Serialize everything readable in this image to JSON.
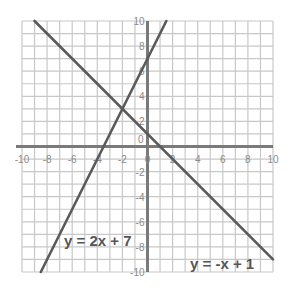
{
  "chart_data": {
    "type": "line",
    "title": "",
    "xlabel": "",
    "ylabel": "",
    "xlim": [
      -10,
      10
    ],
    "ylim": [
      -10,
      10
    ],
    "grid": true,
    "x_ticks": [
      -10,
      -8,
      -6,
      -4,
      -2,
      0,
      2,
      4,
      6,
      8,
      10
    ],
    "y_ticks": [
      -10,
      -8,
      -6,
      -4,
      -2,
      0,
      2,
      4,
      6,
      8,
      10
    ],
    "series": [
      {
        "name": "y = 2x + 7",
        "slope": 2,
        "intercept": 7,
        "x": [
          -8.5,
          1.5
        ],
        "y": [
          -10,
          10
        ]
      },
      {
        "name": "y = -x + 1",
        "slope": -1,
        "intercept": 1,
        "x": [
          -9,
          10
        ],
        "y": [
          10,
          -9
        ]
      }
    ],
    "annotations": [
      {
        "text": "y = 2x + 7",
        "x": -6.3,
        "y": -7.2
      },
      {
        "text": "y = -x + 1",
        "x": 4.8,
        "y": -9.2
      }
    ],
    "intersection": {
      "x": -2,
      "y": 3
    }
  },
  "labels": {
    "eq1": "y = 2x + 7",
    "eq2": "y = -x + 1"
  },
  "colors": {
    "grid": "#c8c8c8",
    "axis": "#7a7a7a",
    "line": "#5a5a5a",
    "text": "#8a8a8a"
  }
}
